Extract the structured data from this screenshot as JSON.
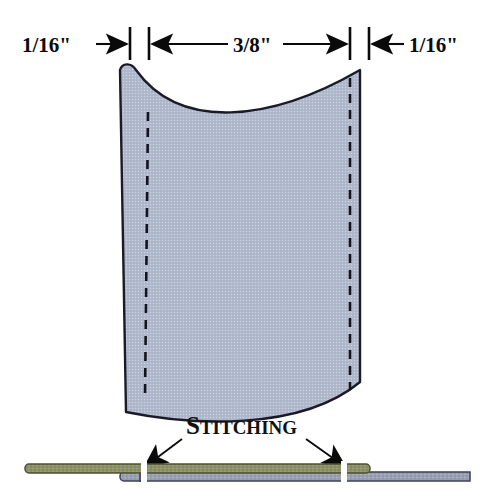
{
  "diagram": {
    "background_color": "#ffffff",
    "dimensions": {
      "left": {
        "label": "1/16\"",
        "numerator": "1",
        "denominator": "16",
        "unit": "\"",
        "arrow_direction": "right"
      },
      "center": {
        "label": "3/8\"",
        "numerator": "3",
        "denominator": "8",
        "unit": "\"",
        "arrow_direction": "both"
      },
      "right": {
        "label": "1/16\"",
        "numerator": "1",
        "denominator": "16",
        "unit": "\"",
        "arrow_direction": "left"
      }
    },
    "callout": {
      "label": "Stitching",
      "first_letter": "S",
      "rest": "TITCHING"
    },
    "fabric_panel": {
      "fill_color": "#b2bacd",
      "outline_color": "#1a1a28",
      "stitch_line_color": "#14141e",
      "stitch_line_style": "dashed",
      "left_stitch_x": 148,
      "right_stitch_x": 350
    },
    "cross_section": {
      "top_layer_color": "#8d9268",
      "top_layer_edge_color": "#4d5033",
      "bottom_layer_color": "#9aa1b2",
      "bottom_layer_edge_color": "#3c4050",
      "gap_color": "#ffffff",
      "gap_positions": [
        145,
        345
      ]
    },
    "colors": {
      "ink": "#0a0a0a",
      "fabric": "#b2bacd",
      "olive": "#8d9268",
      "gray_layer": "#9aa1b2"
    }
  }
}
